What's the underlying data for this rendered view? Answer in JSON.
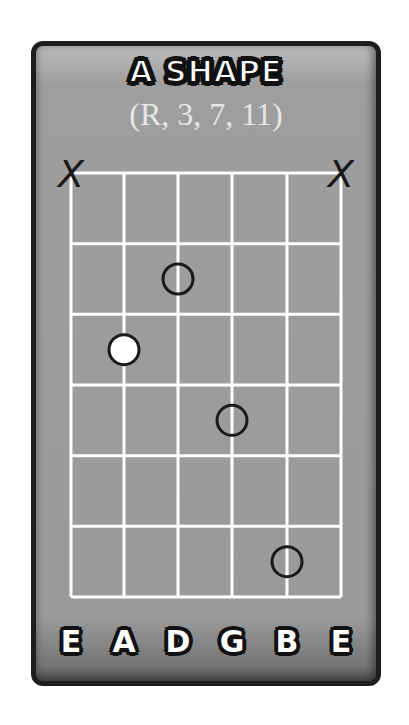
{
  "diagram": {
    "title": "A SHAPE",
    "formula": "(R, 3, 7, 11)",
    "strings": [
      "E",
      "A",
      "D",
      "G",
      "B",
      "E"
    ],
    "num_frets": 6,
    "muted_strings": [
      1,
      6
    ],
    "muted_symbol": "X",
    "dots": [
      {
        "string": 3,
        "fret": 2,
        "filled": false
      },
      {
        "string": 2,
        "fret": 3,
        "filled": true,
        "root": true
      },
      {
        "string": 4,
        "fret": 4,
        "filled": false
      },
      {
        "string": 5,
        "fret": 6,
        "filled": false
      }
    ],
    "colors": {
      "background": "#9e9e9e",
      "grid": "#ffffff",
      "border": "#1e1e1e",
      "dot_outline": "#1a1a1a",
      "root_fill": "#ffffff"
    }
  }
}
